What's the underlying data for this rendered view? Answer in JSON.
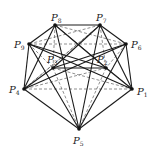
{
  "diagram": {
    "type": "complete-graph",
    "points": [
      {
        "id": "P1",
        "label": "P",
        "sub": "1",
        "x": 132,
        "y": 89,
        "lx": 137,
        "ly": 95
      },
      {
        "id": "P2",
        "label": "P",
        "sub": "2",
        "x": 106,
        "y": 68,
        "lx": 97,
        "ly": 63
      },
      {
        "id": "P3",
        "label": "P",
        "sub": "3",
        "x": 53,
        "y": 68,
        "lx": 47,
        "ly": 63
      },
      {
        "id": "P4",
        "label": "P",
        "sub": "4",
        "x": 24,
        "y": 89,
        "lx": 9,
        "ly": 93
      },
      {
        "id": "P5",
        "label": "P",
        "sub": "5",
        "x": 79,
        "y": 129,
        "lx": 73,
        "ly": 144
      },
      {
        "id": "P6",
        "label": "P",
        "sub": "6",
        "x": 126,
        "y": 44,
        "lx": 131,
        "ly": 48
      },
      {
        "id": "P7",
        "label": "P",
        "sub": "7",
        "x": 100,
        "y": 25,
        "lx": 96,
        "ly": 21
      },
      {
        "id": "P8",
        "label": "P",
        "sub": "8",
        "x": 55,
        "y": 25,
        "lx": 51,
        "ly": 21
      },
      {
        "id": "P9",
        "label": "P",
        "sub": "9",
        "x": 29,
        "y": 44,
        "lx": 14,
        "ly": 48
      }
    ],
    "solid_edges": [
      [
        "P8",
        "P7"
      ],
      [
        "P8",
        "P9"
      ],
      [
        "P7",
        "P6"
      ],
      [
        "P9",
        "P4"
      ],
      [
        "P6",
        "P1"
      ],
      [
        "P4",
        "P5"
      ],
      [
        "P1",
        "P5"
      ],
      [
        "P8",
        "P2"
      ],
      [
        "P7",
        "P3"
      ],
      [
        "P3",
        "P2"
      ],
      [
        "P9",
        "P2"
      ],
      [
        "P6",
        "P3"
      ],
      [
        "P8",
        "P4"
      ],
      [
        "P7",
        "P1"
      ],
      [
        "P9",
        "P5"
      ],
      [
        "P6",
        "P5"
      ],
      [
        "P8",
        "P5"
      ],
      [
        "P7",
        "P5"
      ],
      [
        "P4",
        "P3"
      ],
      [
        "P1",
        "P2"
      ],
      [
        "P4",
        "P6"
      ],
      [
        "P1",
        "P9"
      ]
    ],
    "dashed_edges": [
      [
        "P9",
        "P6"
      ],
      [
        "P4",
        "P1"
      ],
      [
        "P8",
        "P6"
      ],
      [
        "P7",
        "P9"
      ],
      [
        "P8",
        "P1"
      ],
      [
        "P7",
        "P4"
      ],
      [
        "P3",
        "P5"
      ],
      [
        "P2",
        "P5"
      ],
      [
        "P3",
        "P1"
      ],
      [
        "P2",
        "P4"
      ],
      [
        "P8",
        "P3"
      ],
      [
        "P7",
        "P2"
      ],
      [
        "P9",
        "P3"
      ],
      [
        "P6",
        "P2"
      ],
      [
        "P4",
        "P7"
      ],
      [
        "P1",
        "P8"
      ]
    ]
  }
}
